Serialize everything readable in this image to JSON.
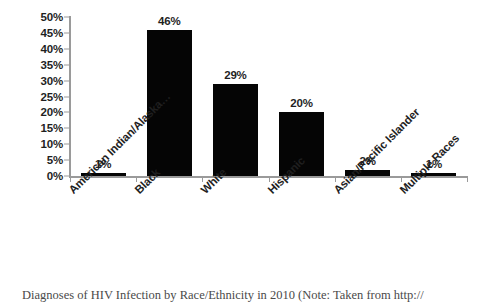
{
  "chart_data": {
    "type": "bar",
    "title": "",
    "xlabel": "",
    "ylabel": "",
    "categories": [
      "American Indian/Alaska…",
      "Black",
      "White",
      "Hispanic",
      "Asian/Pacific Islander",
      "Multiple Races"
    ],
    "values": [
      1,
      46,
      29,
      20,
      2,
      1
    ],
    "data_labels": [
      "1%",
      "46%",
      "29%",
      "20%",
      "2%",
      "1%"
    ],
    "ylim": [
      0,
      50
    ],
    "ytick_values": [
      0,
      5,
      10,
      15,
      20,
      25,
      30,
      35,
      40,
      45,
      50
    ],
    "ytick_labels": [
      "0%",
      "5%",
      "10%",
      "15%",
      "20%",
      "25%",
      "30%",
      "35%",
      "40%",
      "45%",
      "50%"
    ],
    "grid": false,
    "legend": "none",
    "bar_color": "#050505",
    "axis_color": "#9a9a9a",
    "text_color": "#1f1f1f",
    "background": "#ffffff",
    "xtick_label_rotation": -45
  },
  "caption": {
    "text": "Diagnoses of HIV Infection by Race/Ethnicity in 2010 (Note: Taken from http://"
  }
}
